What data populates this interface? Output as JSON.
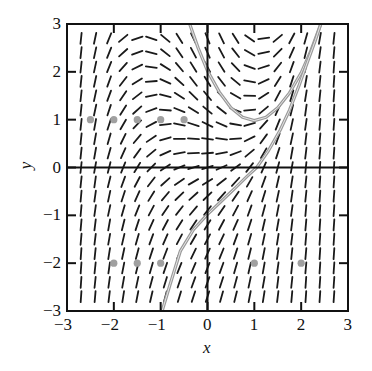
{
  "chart_data": {
    "type": "slope_field",
    "title": "",
    "xlabel": "x",
    "ylabel": "y",
    "xlim": [
      -3,
      3
    ],
    "ylim": [
      -3,
      3
    ],
    "xticks": [
      -3,
      -2,
      -1,
      0,
      1,
      2,
      3
    ],
    "yticks": [
      -3,
      -2,
      -1,
      0,
      1,
      2,
      3
    ],
    "xtick_labels": [
      "−3",
      "−2",
      "−1",
      "0",
      "1",
      "2",
      "3"
    ],
    "ytick_labels": [
      "−3",
      "−2",
      "−1",
      "0",
      "1",
      "2",
      "3"
    ],
    "axes_lines": {
      "x_axis_at_y": 0,
      "y_axis_at_x": 0
    },
    "grid": false,
    "slope_grid": {
      "x": [
        -2.7,
        -2.4,
        -2.1,
        -1.8,
        -1.5,
        -1.2,
        -0.9,
        -0.6,
        -0.3,
        0.0,
        0.3,
        0.6,
        0.9,
        1.2,
        1.5,
        1.8,
        2.1,
        2.4,
        2.7
      ],
      "y": [
        2.7,
        2.4,
        2.1,
        1.8,
        1.5,
        1.2,
        0.9,
        0.6,
        0.3,
        0.0,
        -0.3,
        -0.6,
        -0.9,
        -1.2,
        -1.5,
        -1.8,
        -2.1,
        -2.4,
        -2.7
      ],
      "angles_deg": [
        [
          84,
          78,
          68,
          40,
          18,
          -18,
          -40,
          -58,
          -64,
          -68,
          -64,
          -58,
          -35,
          8,
          40,
          62,
          74,
          80,
          84
        ],
        [
          84,
          78,
          68,
          42,
          20,
          -14,
          -38,
          -56,
          -62,
          -66,
          -62,
          -52,
          -30,
          12,
          45,
          66,
          76,
          82,
          85
        ],
        [
          84,
          78,
          68,
          48,
          26,
          -8,
          -32,
          -50,
          -58,
          -62,
          -58,
          -46,
          -20,
          18,
          52,
          70,
          78,
          83,
          86
        ],
        [
          84,
          78,
          70,
          52,
          32,
          4,
          -24,
          -42,
          -52,
          -58,
          -52,
          -40,
          -10,
          25,
          58,
          72,
          80,
          84,
          86
        ],
        [
          84,
          78,
          70,
          56,
          38,
          12,
          -14,
          -32,
          -44,
          -50,
          -46,
          -30,
          -2,
          32,
          62,
          74,
          81,
          84,
          86
        ],
        [
          84,
          78,
          72,
          58,
          42,
          20,
          -4,
          -22,
          -32,
          -40,
          -38,
          -20,
          6,
          40,
          66,
          76,
          82,
          85,
          86
        ],
        [
          84,
          80,
          72,
          60,
          46,
          28,
          6,
          -12,
          -18,
          -26,
          -24,
          -10,
          16,
          48,
          68,
          78,
          82,
          85,
          86
        ],
        [
          84,
          80,
          74,
          64,
          50,
          34,
          16,
          0,
          -4,
          -8,
          -8,
          4,
          26,
          54,
          70,
          78,
          83,
          85,
          86
        ],
        [
          84,
          80,
          74,
          66,
          54,
          40,
          24,
          10,
          2,
          4,
          10,
          20,
          40,
          60,
          72,
          80,
          83,
          85,
          86
        ],
        [
          84,
          80,
          76,
          68,
          58,
          46,
          34,
          22,
          16,
          18,
          24,
          36,
          52,
          66,
          75,
          80,
          84,
          86,
          86
        ],
        [
          84,
          82,
          76,
          70,
          62,
          52,
          42,
          34,
          30,
          32,
          38,
          48,
          60,
          70,
          77,
          81,
          84,
          86,
          86
        ],
        [
          85,
          82,
          78,
          72,
          66,
          58,
          50,
          44,
          42,
          44,
          48,
          56,
          66,
          73,
          78,
          82,
          84,
          86,
          86
        ],
        [
          85,
          82,
          78,
          74,
          68,
          62,
          56,
          52,
          50,
          52,
          56,
          62,
          70,
          75,
          79,
          82,
          85,
          86,
          86
        ],
        [
          85,
          83,
          80,
          76,
          72,
          66,
          62,
          58,
          56,
          58,
          62,
          66,
          72,
          77,
          80,
          83,
          85,
          86,
          86
        ],
        [
          85,
          83,
          80,
          77,
          74,
          70,
          66,
          62,
          60,
          62,
          65,
          70,
          74,
          78,
          81,
          83,
          85,
          86,
          86
        ],
        [
          86,
          84,
          81,
          78,
          75,
          72,
          69,
          66,
          64,
          65,
          68,
          72,
          76,
          79,
          82,
          84,
          85,
          86,
          86
        ],
        [
          86,
          84,
          82,
          79,
          76,
          74,
          71,
          68,
          67,
          68,
          70,
          74,
          77,
          80,
          82,
          84,
          85,
          86,
          86
        ],
        [
          86,
          84,
          82,
          80,
          78,
          75,
          73,
          71,
          70,
          70,
          72,
          75,
          78,
          80,
          83,
          84,
          86,
          86,
          86
        ],
        [
          86,
          85,
          83,
          81,
          79,
          77,
          75,
          73,
          72,
          72,
          74,
          76,
          79,
          81,
          83,
          85,
          86,
          86,
          86
        ]
      ]
    },
    "solution_curves": [
      {
        "name": "U-shaped curve",
        "color": "#9a9a9a",
        "points": [
          [
            -0.38,
            3.0
          ],
          [
            -0.2,
            2.5
          ],
          [
            0.0,
            2.02
          ],
          [
            0.25,
            1.58
          ],
          [
            0.5,
            1.25
          ],
          [
            0.75,
            1.05
          ],
          [
            1.0,
            0.98
          ],
          [
            1.25,
            1.05
          ],
          [
            1.5,
            1.25
          ],
          [
            1.75,
            1.56
          ],
          [
            2.0,
            1.98
          ],
          [
            2.2,
            2.42
          ],
          [
            2.42,
            3.0
          ]
        ]
      },
      {
        "name": "S-shaped curve",
        "color": "#9a9a9a",
        "points": [
          [
            -0.97,
            -3.0
          ],
          [
            -0.8,
            -2.45
          ],
          [
            -0.58,
            -1.75
          ],
          [
            -0.3,
            -1.3
          ],
          [
            0.0,
            -0.98
          ],
          [
            0.3,
            -0.7
          ],
          [
            0.6,
            -0.42
          ],
          [
            0.85,
            -0.18
          ],
          [
            1.05,
            0.0
          ],
          [
            1.3,
            0.35
          ],
          [
            1.55,
            0.78
          ],
          [
            1.75,
            1.2
          ],
          [
            1.95,
            1.7
          ],
          [
            2.15,
            2.25
          ],
          [
            2.3,
            2.65
          ],
          [
            2.42,
            3.0
          ]
        ]
      }
    ],
    "marked_points": {
      "color": "#a0a0a0",
      "points": [
        [
          -2.5,
          1
        ],
        [
          -2,
          1
        ],
        [
          -1.5,
          1
        ],
        [
          -1,
          1
        ],
        [
          -0.5,
          1
        ],
        [
          -2,
          -2
        ],
        [
          -1.5,
          -2
        ],
        [
          -1,
          -2
        ],
        [
          1,
          -2
        ],
        [
          2,
          -2
        ]
      ]
    },
    "colors": {
      "frame": "#111111",
      "segments": "#1a1a1a",
      "curves": "#9a9a9a",
      "points": "#a0a0a0"
    }
  }
}
